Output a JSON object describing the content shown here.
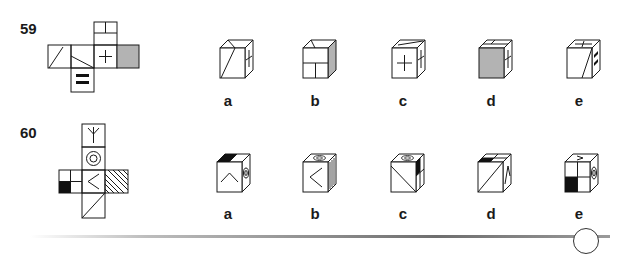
{
  "questions": [
    {
      "number": "59",
      "net_faces": [
        "diagonal-line",
        "diagonal-line",
        "plus-sign",
        "grey-fill",
        "split-box",
        "double-bar"
      ],
      "options": [
        {
          "label": "a",
          "visible_faces": {
            "front": "diagonal-line",
            "top": "diagonal-line",
            "right": "plus-sign"
          }
        },
        {
          "label": "b",
          "visible_faces": {
            "front": "split-box",
            "top": "diagonal-line",
            "right": "grey-fill"
          }
        },
        {
          "label": "c",
          "visible_faces": {
            "front": "plus-sign",
            "top": "diagonal-line",
            "right": "plus-sign"
          }
        },
        {
          "label": "d",
          "visible_faces": {
            "front": "grey-fill",
            "top": "split-box",
            "right": "plus-sign"
          }
        },
        {
          "label": "e",
          "visible_faces": {
            "front": "diagonal-line",
            "top": "plus-sign",
            "right": "double-bar"
          }
        }
      ]
    },
    {
      "number": "60",
      "net_faces": [
        "y-symbol",
        "concentric-circle",
        "chevron",
        "hatched",
        "quartered-black",
        "diagonal-line"
      ],
      "options": [
        {
          "label": "a",
          "visible_faces": {
            "front": "chevron",
            "top": "quartered-black",
            "right": "concentric-circle"
          }
        },
        {
          "label": "b",
          "visible_faces": {
            "front": "chevron",
            "top": "concentric-circle",
            "right": "hatched"
          }
        },
        {
          "label": "c",
          "visible_faces": {
            "front": "diagonal-line",
            "top": "concentric-circle",
            "right": "quartered-black"
          }
        },
        {
          "label": "d",
          "visible_faces": {
            "front": "diagonal-line",
            "top": "quartered-black",
            "right": "chevron"
          }
        },
        {
          "label": "e",
          "visible_faces": {
            "front": "quartered-black",
            "top": "y-symbol",
            "right": "concentric-circle"
          }
        }
      ]
    }
  ],
  "colors": {
    "line": "#1a1a1a",
    "grey_fill": "#b3b3b3",
    "black_fill": "#111111"
  }
}
